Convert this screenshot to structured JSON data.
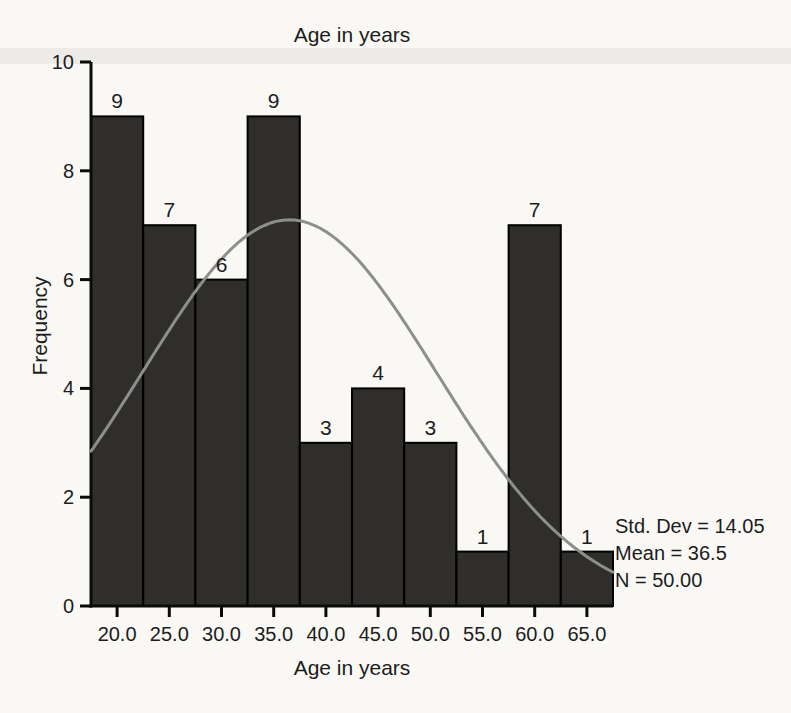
{
  "chart_data": {
    "type": "bar",
    "subtype": "histogram",
    "title": "Age in years",
    "xlabel": "Age in years",
    "ylabel": "Frequency",
    "categories": [
      "20.0",
      "25.0",
      "30.0",
      "35.0",
      "40.0",
      "45.0",
      "50.0",
      "55.0",
      "60.0",
      "65.0"
    ],
    "bin_centers": [
      20,
      25,
      30,
      35,
      40,
      45,
      50,
      55,
      60,
      65
    ],
    "bin_width": 5,
    "values": [
      9,
      7,
      6,
      9,
      3,
      4,
      3,
      1,
      7,
      1
    ],
    "xlim": [
      17.5,
      67.5
    ],
    "ylim": [
      0,
      10
    ],
    "yticks": [
      0,
      2,
      4,
      6,
      8,
      10
    ],
    "grid": false,
    "legend": "none",
    "bar_labels_shown": true,
    "normal_curve": {
      "mean": 36.5,
      "std_dev": 14.05,
      "n": 50
    },
    "annotations": [
      "Std. Dev = 14.05",
      "Mean = 36.5",
      "N = 50.00"
    ],
    "colors": {
      "bar_fill": "#2f2e2b",
      "bar_edge": "#000000",
      "curve": "#8e8e8a",
      "axis": "#0a0a0a",
      "text": "#1c1c1c",
      "page_background": "#f9f8f5",
      "scan_band": "#ecebe7"
    }
  }
}
